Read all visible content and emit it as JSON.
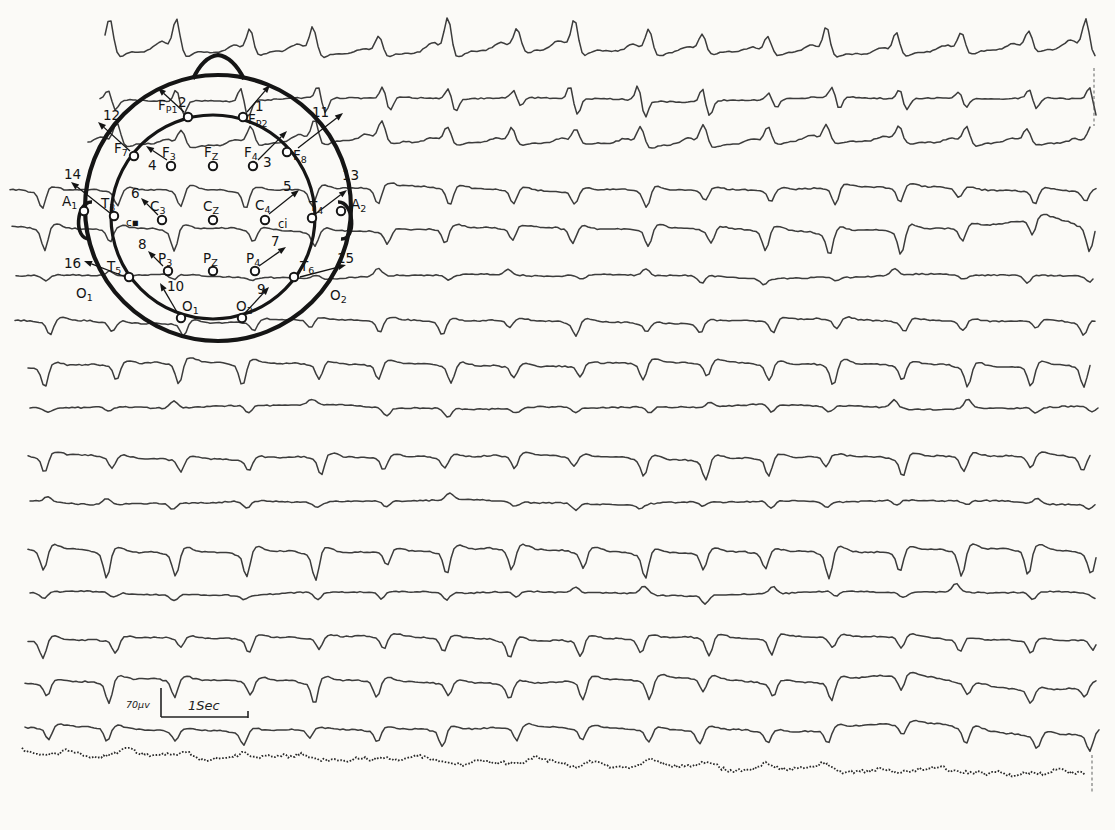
{
  "chart_data": {
    "type": "line",
    "title": "",
    "xlabel": "",
    "ylabel": "",
    "grid": false,
    "legend": "none",
    "calibration": {
      "amplitude_label": "70μv",
      "time_label": "1Sec",
      "time_bar_px_per_sec": 87,
      "amplitude_bar_px": 29
    },
    "complex_positions_px": [
      48,
      112,
      178,
      248,
      315,
      382,
      448,
      512,
      578,
      645,
      705,
      768,
      832,
      900,
      962,
      1032,
      1088
    ],
    "channels": [
      {
        "num": 1,
        "electrode": "Fp2",
        "baseline_y": 52,
        "polarity": "up",
        "amplitude_px": 25,
        "start_x": 105
      },
      {
        "num": 2,
        "electrode": "Fp1",
        "baseline_y": 99,
        "polarity": "biphasic",
        "amplitude_px": 14,
        "start_x": 100
      },
      {
        "num": 3,
        "electrode": "F4",
        "baseline_y": 143,
        "polarity": "up",
        "amplitude_px": 17,
        "start_x": 88
      },
      {
        "num": 4,
        "electrode": "F3",
        "baseline_y": 189,
        "polarity": "down",
        "amplitude_px": 15,
        "start_x": 10
      },
      {
        "num": 5,
        "electrode": "C4",
        "baseline_y": 229,
        "polarity": "down",
        "amplitude_px": 19,
        "start_x": 12
      },
      {
        "num": 6,
        "electrode": "C3",
        "baseline_y": 276,
        "polarity": "mixed",
        "amplitude_px": 9,
        "start_x": 16
      },
      {
        "num": 7,
        "electrode": "P4",
        "baseline_y": 321,
        "polarity": "down",
        "amplitude_px": 12,
        "start_x": 15
      },
      {
        "num": 8,
        "electrode": "P3",
        "baseline_y": 364,
        "polarity": "down",
        "amplitude_px": 17,
        "start_x": 28
      },
      {
        "num": 9,
        "electrode": "O2",
        "baseline_y": 407,
        "polarity": "mixed",
        "amplitude_px": 11,
        "start_x": 30
      },
      {
        "num": 10,
        "electrode": "O1",
        "baseline_y": 457,
        "polarity": "down",
        "amplitude_px": 15,
        "start_x": 28
      },
      {
        "num": 11,
        "electrode": "F8",
        "baseline_y": 502,
        "polarity": "mixed",
        "amplitude_px": 9,
        "start_x": 30
      },
      {
        "num": 12,
        "electrode": "F7",
        "baseline_y": 551,
        "polarity": "down",
        "amplitude_px": 21,
        "start_x": 28
      },
      {
        "num": 13,
        "electrode": "T4",
        "baseline_y": 593,
        "polarity": "mixed",
        "amplitude_px": 10,
        "start_x": 30
      },
      {
        "num": 14,
        "electrode": "T3",
        "baseline_y": 638,
        "polarity": "down",
        "amplitude_px": 15,
        "start_x": 28
      },
      {
        "num": 15,
        "electrode": "T6",
        "baseline_y": 681,
        "polarity": "down",
        "amplitude_px": 17,
        "right_wave": true,
        "start_x": 25
      },
      {
        "num": 16,
        "electrode": "T5",
        "baseline_y": 729,
        "polarity": "down",
        "amplitude_px": 13,
        "right_wave": true,
        "start_x": 25
      },
      {
        "num": 17,
        "electrode": "marker",
        "baseline_y": 753,
        "polarity": "noise",
        "amplitude_px": 6,
        "style": "dotted",
        "start_x": 22
      }
    ]
  },
  "montage": {
    "head": {
      "cx": 218,
      "cy": 208,
      "outer_r": 133,
      "inner_cx": 213,
      "inner_cy": 217,
      "inner_r": 102
    },
    "nose": {
      "d": "M 193 79 Q 203 57 218 55 Q 233 57 244 79"
    },
    "ears": [
      {
        "d": "M 92 202 C 76 201 73 240 90 239"
      },
      {
        "d": "M 338 202 C 354 201 357 240 341 239"
      }
    ],
    "electrodes": [
      {
        "id": "Fp1",
        "main": "F",
        "sub": "P1",
        "ex": 188,
        "ey": 117,
        "lx": 158,
        "ly": 110
      },
      {
        "id": "Fp2",
        "main": "F",
        "sub": "P2",
        "ex": 243,
        "ey": 117,
        "lx": 248,
        "ly": 124
      },
      {
        "id": "F7",
        "main": "F",
        "sub": "7",
        "ex": 134,
        "ey": 156,
        "lx": 114,
        "ly": 153
      },
      {
        "id": "F3",
        "main": "F",
        "sub": "3",
        "ex": 171,
        "ey": 166,
        "lx": 162,
        "ly": 157
      },
      {
        "id": "Fz",
        "main": "F",
        "sub": "Z",
        "ex": 213,
        "ey": 166,
        "lx": 204,
        "ly": 157
      },
      {
        "id": "F4",
        "main": "F",
        "sub": "4",
        "ex": 253,
        "ey": 166,
        "lx": 244,
        "ly": 157
      },
      {
        "id": "F8",
        "main": "F",
        "sub": "8",
        "ex": 287,
        "ey": 152,
        "lx": 293,
        "ly": 160
      },
      {
        "id": "A1",
        "main": "A",
        "sub": "1",
        "ex": 84,
        "ey": 211,
        "lx": 62,
        "ly": 206
      },
      {
        "id": "T3",
        "main": "T",
        "sub": "3",
        "ex": 114,
        "ey": 216,
        "lx": 101,
        "ly": 208
      },
      {
        "id": "C3",
        "main": "C",
        "sub": "3",
        "ex": 162,
        "ey": 220,
        "lx": 150,
        "ly": 211
      },
      {
        "id": "Cz",
        "main": "C",
        "sub": "Z",
        "ex": 213,
        "ey": 220,
        "lx": 203,
        "ly": 211
      },
      {
        "id": "C4",
        "main": "C",
        "sub": "4",
        "ex": 265,
        "ey": 220,
        "lx": 255,
        "ly": 210
      },
      {
        "id": "T4",
        "main": "T",
        "sub": "4",
        "ex": 312,
        "ey": 218,
        "lx": 309,
        "ly": 211
      },
      {
        "id": "A2",
        "main": "A",
        "sub": "2",
        "ex": 341,
        "ey": 211,
        "lx": 351,
        "ly": 209
      },
      {
        "id": "T5",
        "main": "T",
        "sub": "5",
        "ex": 129,
        "ey": 277,
        "lx": 107,
        "ly": 271
      },
      {
        "id": "P3",
        "main": "P",
        "sub": "3",
        "ex": 168,
        "ey": 271,
        "lx": 158,
        "ly": 263
      },
      {
        "id": "Pz",
        "main": "P",
        "sub": "Z",
        "ex": 213,
        "ey": 271,
        "lx": 203,
        "ly": 263
      },
      {
        "id": "P4",
        "main": "P",
        "sub": "4",
        "ex": 255,
        "ey": 271,
        "lx": 246,
        "ly": 263
      },
      {
        "id": "T6",
        "main": "T",
        "sub": "6",
        "ex": 294,
        "ey": 277,
        "lx": 300,
        "ly": 271
      },
      {
        "id": "O1",
        "main": "O",
        "sub": "1",
        "ex": 181,
        "ey": 318,
        "lx": 182,
        "ly": 311
      },
      {
        "id": "O2",
        "main": "O",
        "sub": "2",
        "ex": 242,
        "ey": 318,
        "lx": 236,
        "ly": 311
      }
    ],
    "channel_arrows": [
      {
        "num": "1",
        "lx": 255,
        "ly": 111,
        "x1": 247,
        "y1": 112,
        "x2": 270,
        "y2": 85
      },
      {
        "num": "2",
        "lx": 178,
        "ly": 107,
        "x1": 184,
        "y1": 112,
        "x2": 158,
        "y2": 88
      },
      {
        "num": "3",
        "lx": 263,
        "ly": 167,
        "x1": 258,
        "y1": 160,
        "x2": 287,
        "y2": 131
      },
      {
        "num": "4",
        "lx": 148,
        "ly": 170,
        "x1": 167,
        "y1": 160,
        "x2": 146,
        "y2": 146
      },
      {
        "num": "5",
        "lx": 283,
        "ly": 191,
        "x1": 269,
        "y1": 214,
        "x2": 299,
        "y2": 190
      },
      {
        "num": "6",
        "lx": 131,
        "ly": 198,
        "x1": 158,
        "y1": 215,
        "x2": 141,
        "y2": 198
      },
      {
        "num": "7",
        "lx": 271,
        "ly": 246,
        "x1": 259,
        "y1": 266,
        "x2": 286,
        "y2": 247
      },
      {
        "num": "8",
        "lx": 138,
        "ly": 249,
        "x1": 163,
        "y1": 266,
        "x2": 148,
        "y2": 251
      },
      {
        "num": "9",
        "lx": 257,
        "ly": 294,
        "x1": 245,
        "y1": 313,
        "x2": 269,
        "y2": 287
      },
      {
        "num": "10",
        "lx": 167,
        "ly": 291,
        "x1": 177,
        "y1": 312,
        "x2": 160,
        "y2": 283
      },
      {
        "num": "11",
        "lx": 312,
        "ly": 117,
        "x1": 298,
        "y1": 148,
        "x2": 343,
        "y2": 113
      },
      {
        "num": "12",
        "lx": 103,
        "ly": 120,
        "x1": 130,
        "y1": 151,
        "x2": 98,
        "y2": 122
      },
      {
        "num": "13",
        "lx": 342,
        "ly": 180,
        "x1": 314,
        "y1": 215,
        "x2": 347,
        "y2": 190
      },
      {
        "num": "14",
        "lx": 64,
        "ly": 179,
        "x1": 110,
        "y1": 213,
        "x2": 71,
        "y2": 182
      },
      {
        "num": "15",
        "lx": 337,
        "ly": 263,
        "x1": 300,
        "y1": 277,
        "x2": 346,
        "y2": 265
      },
      {
        "num": "16",
        "lx": 64,
        "ly": 268,
        "x1": 126,
        "y1": 277,
        "x2": 84,
        "y2": 261
      }
    ],
    "extra_labels": [
      {
        "text": "c▪",
        "x": 126,
        "y": 226,
        "size": 10.5
      },
      {
        "text": "ci",
        "x": 278,
        "y": 228,
        "size": 11.5
      }
    ],
    "outer_labels": [
      {
        "main": "O",
        "sub": "1",
        "x": 76,
        "y": 298
      },
      {
        "main": "O",
        "sub": "2",
        "x": 330,
        "y": 300
      }
    ]
  },
  "calibration": {
    "uv_label": "70μv",
    "time_label": "1Sec",
    "bar": {
      "x": 161,
      "y_top": 688,
      "y_bottom": 717,
      "x_end": 248
    },
    "uv_label_xy": [
      126,
      708
    ],
    "time_label_xy": [
      188,
      710
    ]
  },
  "edge_marks": [
    {
      "x": 1094,
      "y1": 68,
      "y2": 126
    },
    {
      "x": 1092,
      "y1": 755,
      "y2": 792
    }
  ]
}
